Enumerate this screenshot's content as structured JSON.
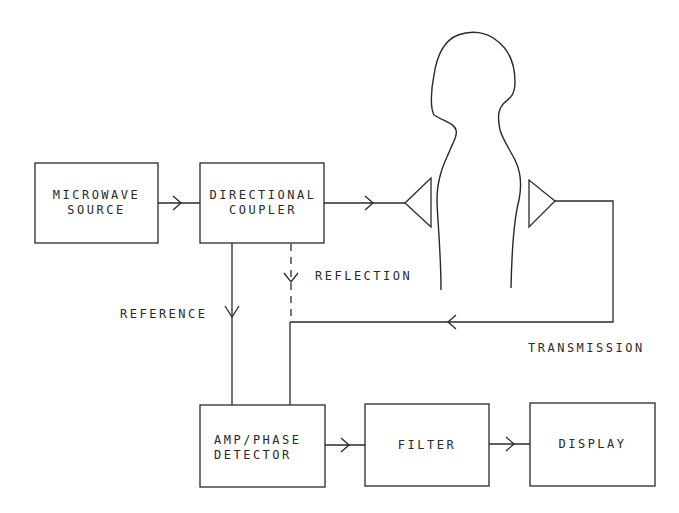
{
  "diagram": {
    "stroke_color": "#2a2a2a",
    "blocks": [
      {
        "id": "microwave_source",
        "line1": "MICROWAVE",
        "line2": "SOURCE"
      },
      {
        "id": "directional_coupler",
        "line1": "DIRECTIONAL",
        "line2": "COUPLER"
      },
      {
        "id": "amp_phase_detector",
        "line1": "AMP/PHASE",
        "line2": "DETECTOR"
      },
      {
        "id": "filter",
        "line1": "FILTER",
        "line2": ""
      },
      {
        "id": "display",
        "line1": "DISPLAY",
        "line2": ""
      }
    ],
    "edge_labels": {
      "reflection": "REFLECTION",
      "reference": "REFERENCE",
      "transmission": "TRANSMISSION"
    },
    "figures": {
      "subject": "human-silhouette",
      "tx_antenna": "transmit-antenna",
      "rx_antenna": "receive-antenna"
    }
  }
}
